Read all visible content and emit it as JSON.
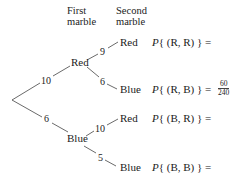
{
  "headers": {
    "first": "First\nmarble",
    "second": "Second\nmarble",
    "first_l1": "First",
    "first_l2": "marble",
    "second_l1": "Second",
    "second_l2": "marble"
  },
  "tree": {
    "first_level": [
      {
        "label": "Red",
        "weight": "10"
      },
      {
        "label": "Blue",
        "weight": "6"
      }
    ],
    "second_level": [
      {
        "parent": "Red",
        "label": "Red",
        "weight": "9"
      },
      {
        "parent": "Red",
        "label": "Blue",
        "weight": "6"
      },
      {
        "parent": "Blue",
        "label": "Red",
        "weight": "10"
      },
      {
        "parent": "Blue",
        "label": "Blue",
        "weight": "5"
      }
    ]
  },
  "probabilities": [
    {
      "p": "P",
      "expr": "{ (R, R) } =",
      "value_num": "",
      "value_den": ""
    },
    {
      "p": "P",
      "expr": "{ (R, B) } =",
      "value_num": "60",
      "value_den": "240"
    },
    {
      "p": "P",
      "expr": "{ (B, R) } =",
      "value_num": "",
      "value_den": ""
    },
    {
      "p": "P",
      "expr": "{ (B, B) } =",
      "value_num": "",
      "value_den": ""
    }
  ]
}
